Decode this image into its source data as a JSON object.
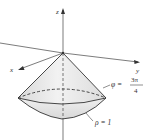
{
  "figure": {
    "axes": {
      "x_label": "x",
      "y_label": "y",
      "z_label": "z"
    },
    "annotations": {
      "cone_label_lhs": "φ =",
      "cone_label_num": "3π",
      "cone_label_den": "4",
      "sphere_label": "ρ = 1"
    },
    "colors": {
      "line": "#333333",
      "fill": "#e6e6e6",
      "fill_light": "#f3f3f3"
    }
  }
}
